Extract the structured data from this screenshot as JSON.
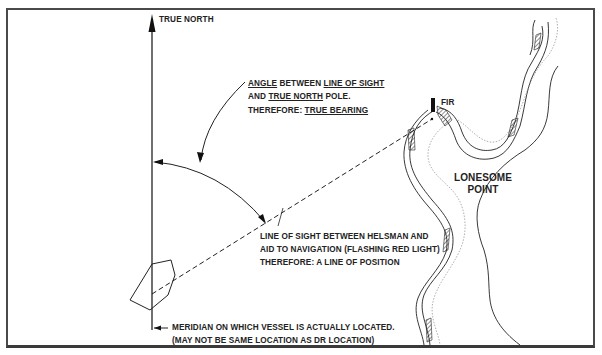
{
  "diagram": {
    "true_north_label": "TRUE NORTH",
    "angle_note": {
      "line1_a": "ANGLE",
      "line1_b": " BETWEEN ",
      "line1_c": "LINE OF SIGHT",
      "line2_a": "AND ",
      "line2_b": "TRUE NORTH",
      "line2_c": " POLE.",
      "line3_a": "THEREFORE: ",
      "line3_b": "TRUE BEARING"
    },
    "line_of_sight_note": {
      "line1": "LINE OF SIGHT BETWEEN HELSMAN AND",
      "line2": "AID TO NAVIGATION (FLASHING RED LIGHT)",
      "line3": "THEREFORE: A LINE OF POSITION"
    },
    "meridian_note": {
      "line1": "MERIDIAN ON WHICH VESSEL IS ACTUALLY LOCATED.",
      "line2": "(MAY NOT BE SAME LOCATION AS DR LOCATION)"
    },
    "aid_label": "FIR",
    "landmark_label_line1": "LONESOME",
    "landmark_label_line2": "POINT",
    "colors": {
      "ink": "#222222",
      "frame": "#4a4a4a",
      "shoreline_dotted": "#9a9a9a"
    }
  }
}
